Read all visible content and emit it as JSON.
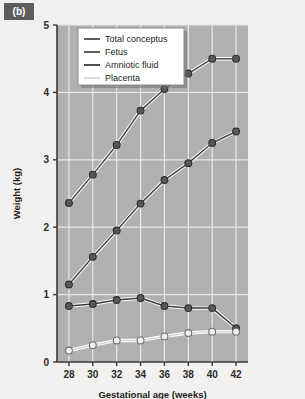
{
  "panel": {
    "label": "(b)"
  },
  "chart_data": {
    "type": "line",
    "title": "",
    "xlabel": "Gestational age (weeks)",
    "ylabel": "Weight (kg)",
    "x": [
      28,
      30,
      32,
      34,
      36,
      38,
      40,
      42
    ],
    "xlim": [
      27,
      43
    ],
    "ylim": [
      0,
      5
    ],
    "xticks": [
      28,
      30,
      32,
      34,
      36,
      38,
      40,
      42
    ],
    "yticks": [
      0,
      1,
      2,
      3,
      4,
      5
    ],
    "grid": true,
    "legend_position": "top-left",
    "series": [
      {
        "name": "Total conceptus",
        "values": [
          2.36,
          2.78,
          3.22,
          3.73,
          4.05,
          4.28,
          4.5,
          4.5
        ],
        "marker": "filled-circle",
        "color": "#4a4a4a"
      },
      {
        "name": "Fetus",
        "values": [
          1.15,
          1.56,
          1.95,
          2.35,
          2.7,
          2.95,
          3.25,
          3.42
        ],
        "marker": "filled-circle",
        "color": "#4a4a4a"
      },
      {
        "name": "Amniotic fluid",
        "values": [
          0.83,
          0.86,
          0.92,
          0.95,
          0.83,
          0.8,
          0.8,
          0.5
        ],
        "marker": "filled-circle",
        "color": "#3d3d3d"
      },
      {
        "name": "Placenta",
        "values": [
          0.17,
          0.25,
          0.32,
          0.32,
          0.38,
          0.43,
          0.45,
          0.45
        ],
        "marker": "open-circle",
        "color": "#d8d8d8"
      }
    ]
  },
  "style": {
    "plot_background": "#b0b0b0",
    "gridline_color": "#e8e8e8",
    "axis_color": "#3a3a3a",
    "page_background": "#f2f1ef",
    "panel_label_background": "#5d5d5d"
  }
}
